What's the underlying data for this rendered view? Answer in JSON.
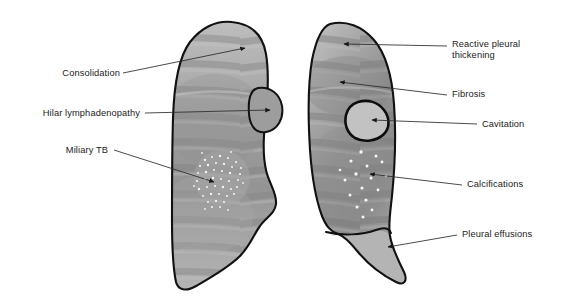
{
  "figure": {
    "background_color": "#ffffff",
    "outline_color": "#111111",
    "lung_fill_light": "#b9b9b9",
    "lung_fill_mid": "#9a9a9a",
    "lung_fill_dark": "#7d7d7d",
    "effusion_fill": "#b3b3b3",
    "speckle_color": "#f2f2f2",
    "leader_color": "#2a2a2a"
  },
  "labels": {
    "left": [
      {
        "id": "consolidation",
        "text": "Consolidation",
        "target": "left-lung-apex"
      },
      {
        "id": "hilar-lymphadenopathy",
        "text": "Hilar lymphadenopathy",
        "target": "left-lung-hilar-mass"
      },
      {
        "id": "miliary-tb",
        "text": "Miliary TB",
        "target": "left-lung-miliary-patch"
      }
    ],
    "right": [
      {
        "id": "reactive-pleural-thickening",
        "text": "Reactive pleural thickening",
        "line1": "Reactive pleural",
        "line2": "thickening",
        "target": "right-lung-apex"
      },
      {
        "id": "fibrosis",
        "text": "Fibrosis",
        "target": "right-lung-upper-zone"
      },
      {
        "id": "cavitation",
        "text": "Cavitation",
        "target": "right-lung-cavity"
      },
      {
        "id": "calcifications",
        "text": "Calcifications",
        "target": "right-lung-calcific-dots"
      },
      {
        "id": "pleural-effusions",
        "text": "Pleural effusions",
        "target": "right-lung-effusion-wedge"
      }
    ]
  },
  "features": {
    "left_lung": {
      "name": "left-lung",
      "findings": [
        "Consolidation",
        "Hilar lymphadenopathy",
        "Miliary TB"
      ]
    },
    "right_lung": {
      "name": "right-lung",
      "findings": [
        "Reactive pleural thickening",
        "Fibrosis",
        "Cavitation",
        "Calcifications",
        "Pleural effusions"
      ]
    }
  }
}
